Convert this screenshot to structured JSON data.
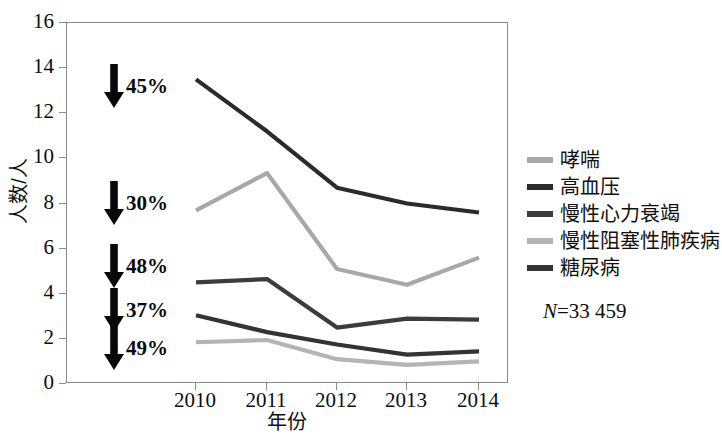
{
  "chart_data": {
    "type": "line",
    "title": "",
    "subtitle": "",
    "xlabel": "年份",
    "ylabel": "人数/人",
    "x": [
      "2010",
      "2011",
      "2012",
      "2013",
      "2014"
    ],
    "categories": [
      "2010",
      "2011",
      "2012",
      "2013",
      "2014"
    ],
    "xlim": [
      2009.6,
      2014.4
    ],
    "ylim": [
      0,
      16
    ],
    "yticks": [
      0,
      2,
      4,
      6,
      8,
      10,
      12,
      14,
      16
    ],
    "grid": false,
    "legend_position": "right",
    "series": [
      {
        "name": "哮喘",
        "color": "#a8a8a8",
        "values": [
          7.7,
          9.35,
          5.1,
          4.4,
          5.6
        ]
      },
      {
        "name": "高血压",
        "color": "#2b2b2b",
        "values": [
          13.5,
          11.2,
          8.7,
          8.0,
          7.6
        ]
      },
      {
        "name": "慢性心力衰竭",
        "color": "#3c3c3c",
        "values": [
          4.5,
          4.65,
          2.5,
          2.9,
          2.85
        ]
      },
      {
        "name": "慢性阻塞性肺疾病",
        "color": "#b4b4b4",
        "values": [
          1.85,
          1.95,
          1.1,
          0.85,
          1.0
        ]
      },
      {
        "name": "糖尿病",
        "color": "#333333",
        "values": [
          3.05,
          2.3,
          1.75,
          1.3,
          1.45
        ]
      }
    ],
    "annotations": [
      {
        "label": "45%",
        "icon": "down-arrow",
        "series": "高血压",
        "y_value": 12.8
      },
      {
        "label": "30%",
        "icon": "down-arrow",
        "series": "哮喘",
        "y_value": 7.7
      },
      {
        "label": "48%",
        "icon": "down-arrow",
        "series": "慢性心力衰竭",
        "y_value": 5.05
      },
      {
        "label": "37%",
        "icon": "down-arrow",
        "series": "糖尿病",
        "y_value": 3.35
      },
      {
        "label": "49%",
        "icon": "down-arrow",
        "series": "慢性阻塞性肺疾病",
        "y_value": 1.7
      }
    ],
    "notes": {
      "n_symbol": "N",
      "n_text": "=33 459"
    }
  },
  "axes": {
    "y_tick_labels": [
      "16",
      "14",
      "12",
      "10",
      "8",
      "6",
      "4",
      "2",
      "0"
    ],
    "x_tick_labels": [
      "2010",
      "2011",
      "2012",
      "2013",
      "2014"
    ],
    "x_title": "年份",
    "y_title": "人数/人"
  },
  "legend": {
    "items": [
      {
        "label": "哮喘",
        "color": "#a8a8a8"
      },
      {
        "label": "高血压",
        "color": "#2b2b2b"
      },
      {
        "label": "慢性心力衰竭",
        "color": "#3c3c3c"
      },
      {
        "label": "慢性阻塞性肺疾病",
        "color": "#b4b4b4"
      },
      {
        "label": "糖尿病",
        "color": "#333333"
      }
    ]
  },
  "annotations": {
    "a0": "45%",
    "a1": "30%",
    "a2": "48%",
    "a3": "37%",
    "a4": "49%"
  },
  "note": {
    "symbol": "N",
    "value": "=33 459"
  }
}
